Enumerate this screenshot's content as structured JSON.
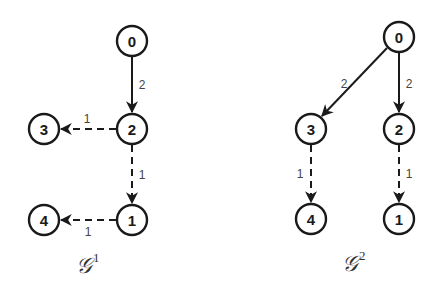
{
  "graphs": [
    {
      "label": "𝒢",
      "superscript": "1",
      "nodes": [
        {
          "id": "0",
          "x": 132,
          "y": 41
        },
        {
          "id": "2",
          "x": 132,
          "y": 129
        },
        {
          "id": "3",
          "x": 44,
          "y": 129
        },
        {
          "id": "1",
          "x": 132,
          "y": 220
        },
        {
          "id": "4",
          "x": 44,
          "y": 220
        }
      ],
      "edges": [
        {
          "from": "0",
          "to": "2",
          "weight": "2",
          "style": "solid"
        },
        {
          "from": "2",
          "to": "3",
          "weight": "1",
          "style": "dashed"
        },
        {
          "from": "2",
          "to": "1",
          "weight": "1",
          "style": "dashed"
        },
        {
          "from": "1",
          "to": "4",
          "weight": "1",
          "style": "dashed"
        }
      ]
    },
    {
      "label": "𝒢",
      "superscript": "2",
      "nodes": [
        {
          "id": "0",
          "x": 399,
          "y": 37
        },
        {
          "id": "3",
          "x": 311,
          "y": 129
        },
        {
          "id": "2",
          "x": 399,
          "y": 129
        },
        {
          "id": "4",
          "x": 311,
          "y": 219
        },
        {
          "id": "1",
          "x": 399,
          "y": 219
        }
      ],
      "edges": [
        {
          "from": "0",
          "to": "3",
          "weight": "2",
          "style": "solid"
        },
        {
          "from": "0",
          "to": "2",
          "weight": "2",
          "style": "solid"
        },
        {
          "from": "3",
          "to": "4",
          "weight": "1",
          "style": "dashed"
        },
        {
          "from": "2",
          "to": "1",
          "weight": "1",
          "style": "dashed"
        }
      ]
    }
  ]
}
